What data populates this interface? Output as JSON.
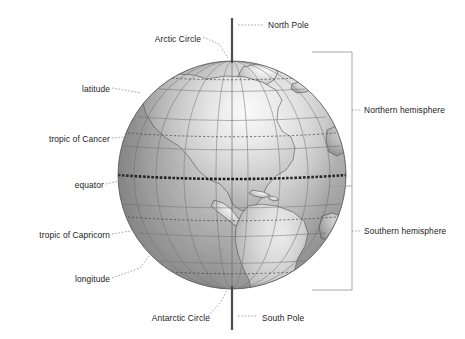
{
  "figure": {
    "kind": "labelled-globe-diagram",
    "background_color": "#ffffff",
    "ink_color": "#1b1b1b",
    "leader_color": "#8e8e8e"
  },
  "globe": {
    "center_x": 232,
    "center_y": 175,
    "radius": 114,
    "ocean_color": "#9a9a9a",
    "land_color": "#b4b4b4",
    "highlight_color": "#ebebeb",
    "shadow_color": "#6d6d6d",
    "visible_continents": [
      "North America",
      "South America",
      "Greenland",
      "Central America",
      "Caribbean"
    ]
  },
  "axis": {
    "name": "axis-of-rotation",
    "color": "#4c4c4c",
    "top_y": 18,
    "bottom_y": 330
  },
  "labels": {
    "north_pole": "North Pole",
    "arctic_circle": "Arctic Circle",
    "latitude": "latitude",
    "tropic_of_cancer": "tropic of Cancer",
    "equator": "equator",
    "tropic_of_capricorn": "tropic of Capricorn",
    "longitude": "longitude",
    "antarctic_circle": "Antarctic Circle",
    "south_pole": "South Pole",
    "northern_hemisphere": "Northern hemisphere",
    "southern_hemisphere": "Southern hemisphere"
  },
  "label_positions": {
    "north_pole": {
      "x": 268,
      "y": 25,
      "align": "right"
    },
    "arctic_circle": {
      "x": 201,
      "y": 39,
      "align": "left"
    },
    "latitude": {
      "x": 110,
      "y": 89,
      "align": "left"
    },
    "tropic_of_cancer": {
      "x": 110,
      "y": 139,
      "align": "left"
    },
    "equator": {
      "x": 104,
      "y": 185,
      "align": "left"
    },
    "tropic_of_capricorn": {
      "x": 110,
      "y": 235,
      "align": "left"
    },
    "longitude": {
      "x": 110,
      "y": 279,
      "align": "left"
    },
    "antarctic_circle": {
      "x": 210,
      "y": 318,
      "align": "left"
    },
    "south_pole": {
      "x": 262,
      "y": 318,
      "align": "right"
    },
    "northern_hemisphere": {
      "x": 364,
      "y": 110,
      "align": "right"
    },
    "southern_hemisphere": {
      "x": 364,
      "y": 231,
      "align": "right"
    }
  },
  "hemisphere_bracket": {
    "x": 352,
    "top_y": 52,
    "equator_y": 186,
    "bottom_y": 290,
    "arm_to_globe_x": 312,
    "color": "#9d9d9d"
  },
  "reference_lines": {
    "equator": {
      "latitude_deg": 0,
      "style": "heavy-dashed",
      "color": "#141414"
    },
    "tropic_of_cancer": {
      "latitude_deg": 23.5,
      "style": "dashed",
      "color": "#3d3d3d"
    },
    "tropic_of_capricorn": {
      "latitude_deg": -23.5,
      "style": "dashed",
      "color": "#3d3d3d"
    },
    "arctic_circle": {
      "latitude_deg": 66.5,
      "style": "dashed",
      "color": "#3d3d3d"
    },
    "antarctic_circle": {
      "latitude_deg": -66.5,
      "style": "dashed",
      "color": "#3d3d3d"
    },
    "parallels_spacing_deg": 15,
    "meridians_spacing_deg": 20
  }
}
